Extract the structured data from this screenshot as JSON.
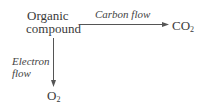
{
  "diagram": {
    "nodes": {
      "organic_line1": "Organic",
      "organic_line2": "compound",
      "co2_main": "CO",
      "co2_sub": "2",
      "o2_main": "O",
      "o2_sub": "2"
    },
    "edges": {
      "carbon_flow": "Carbon flow",
      "electron_flow_line1": "Electron",
      "electron_flow_line2": "flow"
    },
    "colors": {
      "arrow": "#555555",
      "text": "#3a3a3a"
    }
  }
}
